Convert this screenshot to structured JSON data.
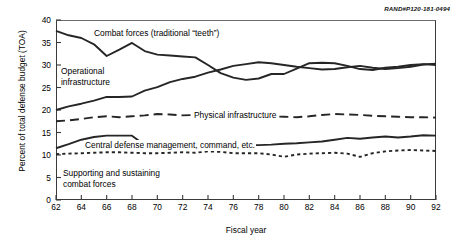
{
  "figure": {
    "source_id": "RAND#P120-181-0494",
    "ylabel": "Percent of total defense budget (TOA)",
    "xlabel": "Fiscal year"
  },
  "labels": {
    "combat": "Combat forces (traditional “teeth”)",
    "operational": "Operational\ninfrastructure",
    "operational_line1": "Operational",
    "operational_line2": "infrastructure",
    "physical": "Physical infrastructure",
    "central": "Central defense management, command, etc.",
    "supporting_line1": "Supporting and sustaining",
    "supporting_line2": "combat forces"
  },
  "axis": {
    "y_ticks": [
      "0",
      "5",
      "10",
      "15",
      "20",
      "25",
      "30",
      "35",
      "40"
    ],
    "x_ticks": [
      "62",
      "64",
      "66",
      "68",
      "70",
      "72",
      "74",
      "76",
      "78",
      "80",
      "82",
      "84",
      "86",
      "88",
      "90",
      "92"
    ]
  },
  "chart_data": {
    "type": "line",
    "title": "",
    "xlabel": "Fiscal year",
    "ylabel": "Percent of total defense budget (TOA)",
    "xlim": [
      62,
      92
    ],
    "ylim": [
      0,
      40
    ],
    "grid": false,
    "legend": "inline-annotations",
    "x": [
      62,
      63,
      64,
      65,
      66,
      67,
      68,
      69,
      70,
      71,
      72,
      73,
      74,
      75,
      76,
      77,
      78,
      79,
      80,
      81,
      82,
      83,
      84,
      85,
      86,
      87,
      88,
      89,
      90,
      91,
      92
    ],
    "series": [
      {
        "name": "Combat forces (traditional “teeth”)",
        "style": "solid",
        "color": "#262626",
        "values": [
          37.6,
          36.6,
          36.0,
          34.6,
          32.0,
          33.4,
          34.9,
          33.1,
          32.3,
          32.1,
          31.9,
          31.7,
          30.0,
          28.2,
          27.2,
          26.7,
          27.0,
          28.0,
          28.0,
          29.2,
          30.4,
          30.5,
          30.4,
          29.8,
          29.1,
          28.9,
          29.4,
          29.6,
          30.0,
          30.2,
          30.0
        ]
      },
      {
        "name": "Operational infrastructure",
        "style": "solid",
        "color": "#262626",
        "values": [
          20.0,
          20.8,
          21.4,
          22.1,
          22.9,
          22.9,
          23.0,
          24.3,
          25.1,
          26.2,
          26.9,
          27.4,
          28.3,
          29.0,
          29.8,
          30.2,
          30.6,
          30.4,
          30.0,
          29.6,
          29.3,
          29.0,
          29.1,
          29.5,
          29.8,
          29.4,
          29.1,
          29.3,
          29.6,
          30.1,
          30.3
        ]
      },
      {
        "name": "Physical infrastructure",
        "style": "dashed",
        "color": "#262626",
        "values": [
          17.5,
          17.7,
          18.0,
          18.4,
          18.6,
          18.4,
          18.6,
          18.8,
          19.1,
          19.0,
          18.8,
          18.9,
          19.1,
          19.3,
          19.2,
          18.9,
          18.7,
          18.6,
          18.5,
          18.4,
          18.6,
          18.9,
          19.1,
          19.0,
          18.9,
          18.7,
          18.6,
          18.5,
          18.4,
          18.4,
          18.3
        ]
      },
      {
        "name": "Central defense management, command, etc.",
        "style": "solid",
        "color": "#262626",
        "values": [
          11.5,
          12.4,
          13.4,
          14.0,
          14.3,
          14.3,
          14.3,
          12.2,
          12.2,
          12.2,
          12.2,
          12.2,
          12.2,
          12.2,
          12.2,
          12.2,
          12.2,
          12.3,
          12.5,
          12.6,
          12.8,
          13.0,
          13.4,
          13.8,
          13.6,
          13.9,
          14.1,
          13.9,
          14.1,
          14.4,
          14.3
        ]
      },
      {
        "name": "Supporting and sustaining combat forces",
        "style": "dotted",
        "color": "#262626",
        "values": [
          10.2,
          10.3,
          10.4,
          10.5,
          10.6,
          10.6,
          10.5,
          10.4,
          10.4,
          10.5,
          10.6,
          10.5,
          10.8,
          10.7,
          10.4,
          10.4,
          10.4,
          10.1,
          9.6,
          10.1,
          10.3,
          10.4,
          10.5,
          10.3,
          9.6,
          10.4,
          10.8,
          11.0,
          11.1,
          11.0,
          10.9
        ]
      }
    ]
  }
}
